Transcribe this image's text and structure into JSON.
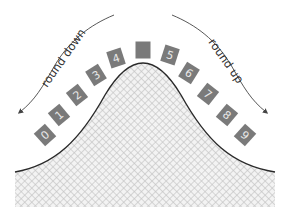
{
  "diagram": {
    "labels": {
      "left": "round down",
      "right": "round up"
    },
    "digits": [
      {
        "value": "0",
        "x": 45,
        "y": 135,
        "angle": -42
      },
      {
        "value": "1",
        "x": 59,
        "y": 115,
        "angle": -40
      },
      {
        "value": "2",
        "x": 77,
        "y": 95,
        "angle": -38
      },
      {
        "value": "3",
        "x": 96,
        "y": 75,
        "angle": -32
      },
      {
        "value": "4",
        "x": 116,
        "y": 58,
        "angle": -18
      },
      {
        "value": "",
        "x": 143,
        "y": 50,
        "angle": 0
      },
      {
        "value": "5",
        "x": 170,
        "y": 55,
        "angle": 18
      },
      {
        "value": "6",
        "x": 189,
        "y": 73,
        "angle": 32
      },
      {
        "value": "7",
        "x": 208,
        "y": 94,
        "angle": 38
      },
      {
        "value": "8",
        "x": 227,
        "y": 115,
        "angle": 40
      },
      {
        "value": "9",
        "x": 245,
        "y": 135,
        "angle": 42
      }
    ],
    "colors": {
      "box_fill": "#7a7a7a",
      "box_text": "#e8e8e8",
      "curve": "#2a2a2a",
      "hatch": "#c4c4c4",
      "arrow": "#444444"
    }
  }
}
